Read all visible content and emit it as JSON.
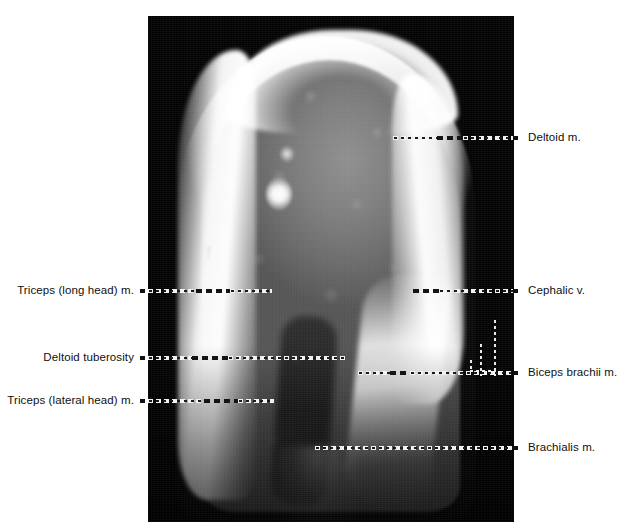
{
  "figure": {
    "kind": "anatomical-cross-section-scan",
    "region": "upper arm / humerus",
    "background_color": "#ffffff",
    "plate_color": "#040404"
  },
  "annotations": {
    "left": [
      {
        "id": "triceps-long-head",
        "text": "Triceps (long head) m.",
        "y": 291
      },
      {
        "id": "deltoid-tuberosity",
        "text": "Deltoid tuberosity",
        "y": 358
      },
      {
        "id": "triceps-lateral-head",
        "text": "Triceps (lateral head) m.",
        "y": 401
      }
    ],
    "right": [
      {
        "id": "deltoid",
        "text": "Deltoid m.",
        "y": 138
      },
      {
        "id": "cephalic-vein",
        "text": "Cephalic v.",
        "y": 291
      },
      {
        "id": "biceps-brachii",
        "text": "Biceps brachii m.",
        "y": 373
      },
      {
        "id": "brachialis",
        "text": "Brachialis m.",
        "y": 448
      }
    ]
  },
  "markers": {
    "tuberosity_bracket": "deltoid-tuberosity-extent-bracket"
  }
}
